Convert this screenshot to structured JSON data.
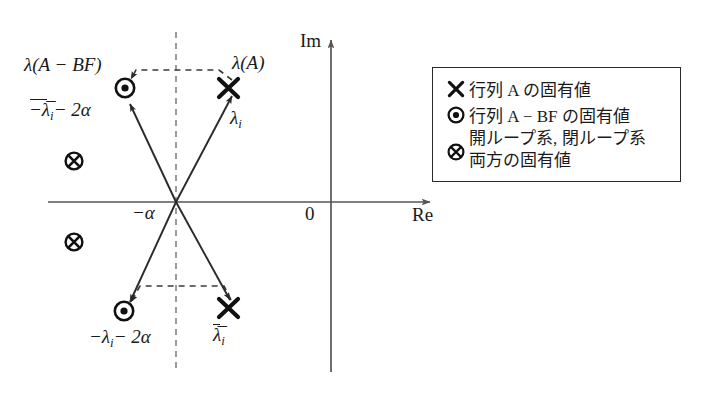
{
  "figure": {
    "type": "complex-plane-eigenvalue-diagram",
    "axes": {
      "real_axis_label": "Re",
      "imaginary_axis_label": "Im",
      "origin_label": "0",
      "shift_label": "−α"
    },
    "annotations": {
      "open_loop_group": "λ(A)",
      "closed_loop_group": "λ(A − BF)",
      "upper_open_point": "λ",
      "upper_open_point_sub": "i",
      "upper_closed_point": "−λ̅",
      "upper_closed_point_sub": "i",
      "upper_closed_point_tail": "− 2α",
      "lower_open_point": "λ̅",
      "lower_open_point_sub": "i",
      "lower_closed_point": "−λ",
      "lower_closed_point_sub": "i",
      "lower_closed_point_tail": "− 2α"
    },
    "legend": {
      "items": [
        {
          "symbol": "cross-marker",
          "text": "行列 A の固有値",
          "lines": [
            "行列 A の固有値"
          ]
        },
        {
          "symbol": "dot-in-circle-marker",
          "text": "行列 A − BF の固有値",
          "lines": [
            "行列 A − BF の固有値"
          ]
        },
        {
          "symbol": "cross-in-circle-marker",
          "text": "開ループ系, 閉ループ系 両方の固有値",
          "lines": [
            "開ループ系, 閉ループ系",
            "両方の固有値"
          ]
        }
      ]
    },
    "colors": {
      "ink": "#1a1a1a",
      "axis": "#555555",
      "dashed": "#8a8a8a",
      "background": "#ffffff"
    },
    "markers": [
      {
        "name": "open-loop-upper",
        "kind": "cross",
        "x": 228,
        "y": 88
      },
      {
        "name": "closed-loop-upper",
        "kind": "dot-in-circle",
        "x": 125,
        "y": 88
      },
      {
        "name": "open-loop-lower",
        "kind": "cross",
        "x": 228,
        "y": 308
      },
      {
        "name": "closed-loop-lower",
        "kind": "dot-in-circle",
        "x": 124,
        "y": 311
      },
      {
        "name": "both-upper",
        "kind": "cross-in-circle",
        "x": 74,
        "y": 161
      },
      {
        "name": "both-lower",
        "kind": "cross-in-circle",
        "x": 74,
        "y": 242
      }
    ]
  }
}
